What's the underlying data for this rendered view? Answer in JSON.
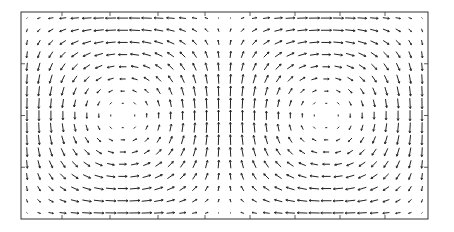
{
  "chart_data": {
    "type": "quiver",
    "title": "",
    "xlabel": "",
    "ylabel": "",
    "grid": false,
    "legend": null,
    "domain": {
      "x": [
        0,
        2
      ],
      "y": [
        0,
        1
      ]
    },
    "grid_size": {
      "cols": 34,
      "rows": 17
    },
    "field": {
      "u": "sin(pi*x) * cos(pi*y)",
      "v": "-cos(pi*x) * sin(pi*y)",
      "note": "Left cell: upward flow at left wall, rightward along top, downward at center x=1, leftward along bottom. Right cell mirrored."
    },
    "cells": [
      {
        "name": "left-vortex",
        "center": [
          0.5,
          0.5
        ],
        "rotation": "clockwise"
      },
      {
        "name": "right-vortex",
        "center": [
          1.5,
          0.5
        ],
        "rotation": "counter-clockwise"
      }
    ],
    "frame": {
      "left": 21,
      "top": 12,
      "right": 428,
      "bottom": 219
    },
    "top_ticks_px": [
      62,
      110,
      158,
      205,
      250,
      295,
      340,
      385
    ],
    "colors": {
      "arrow": "#222222",
      "frame": "#333333",
      "background": "#ffffff"
    }
  }
}
